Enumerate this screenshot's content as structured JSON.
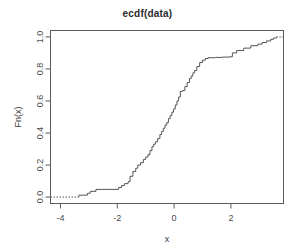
{
  "plot": {
    "title": "ecdf(data)",
    "background": "#ffffff",
    "line_color": "#555555",
    "frame_color": "#5a5a5a"
  },
  "chart_data": {
    "type": "line",
    "title": "ecdf(data)",
    "xlabel": "x",
    "ylabel": "Fn(x)",
    "xlim": [
      -4.35,
      3.85
    ],
    "ylim": [
      -0.04,
      1.04
    ],
    "xticks": [
      -4,
      -2,
      0,
      2
    ],
    "xtick_labels": [
      "-4",
      "-2",
      "0",
      "2"
    ],
    "yticks": [
      0.0,
      0.2,
      0.4,
      0.6,
      0.8,
      1.0
    ],
    "ytick_labels": [
      "0.0",
      "0.2",
      "0.4",
      "0.6",
      "0.8",
      "1.0"
    ],
    "grid": false,
    "legend": null,
    "step_style": "hv",
    "left_tail": {
      "from_x": -4.35,
      "to_x": -3.35,
      "y": 0.0,
      "dashed": true
    },
    "right_tail": {
      "from_x": 3.6,
      "to_x": 3.85,
      "y": 1.0,
      "dashed": true
    },
    "x": [
      -3.35,
      -3.05,
      -2.95,
      -2.75,
      -1.95,
      -1.85,
      -1.75,
      -1.62,
      -1.55,
      -1.45,
      -1.35,
      -1.28,
      -1.18,
      -1.08,
      -1.0,
      -0.92,
      -0.85,
      -0.78,
      -0.72,
      -0.66,
      -0.58,
      -0.5,
      -0.44,
      -0.38,
      -0.32,
      -0.26,
      -0.2,
      -0.14,
      -0.08,
      -0.02,
      0.04,
      0.1,
      0.16,
      0.22,
      0.3,
      0.38,
      0.46,
      0.54,
      0.6,
      0.66,
      0.72,
      0.8,
      0.9,
      1.0,
      1.1,
      1.2,
      1.45,
      1.7,
      1.95,
      2.05,
      2.2,
      2.45,
      2.7,
      2.95,
      3.1,
      3.25,
      3.4,
      3.5,
      3.6
    ],
    "y": [
      0.012,
      0.024,
      0.036,
      0.048,
      0.06,
      0.072,
      0.084,
      0.096,
      0.13,
      0.16,
      0.18,
      0.2,
      0.215,
      0.235,
      0.25,
      0.265,
      0.29,
      0.315,
      0.33,
      0.345,
      0.365,
      0.39,
      0.41,
      0.43,
      0.45,
      0.465,
      0.49,
      0.51,
      0.53,
      0.55,
      0.575,
      0.6,
      0.625,
      0.66,
      0.665,
      0.69,
      0.715,
      0.74,
      0.755,
      0.775,
      0.79,
      0.815,
      0.84,
      0.855,
      0.865,
      0.87,
      0.872,
      0.874,
      0.876,
      0.9,
      0.915,
      0.93,
      0.945,
      0.955,
      0.965,
      0.975,
      0.985,
      0.993,
      1.0
    ]
  }
}
